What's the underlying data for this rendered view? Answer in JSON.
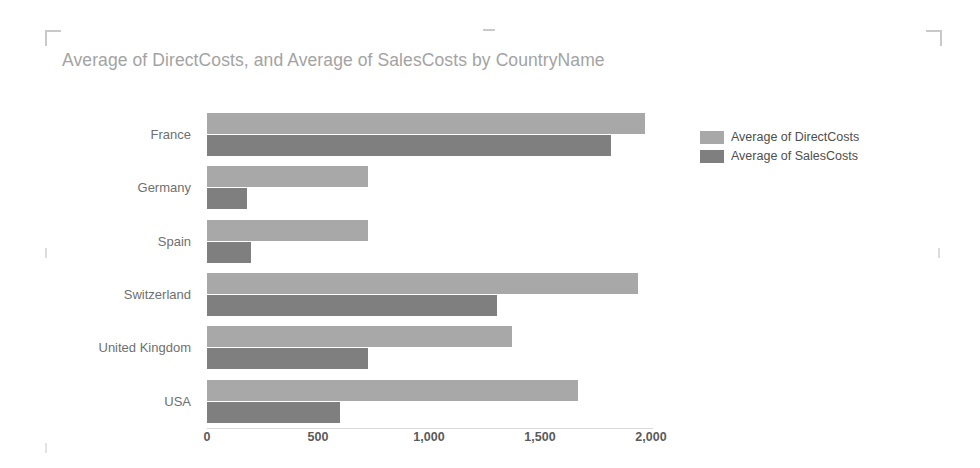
{
  "chart_data": {
    "type": "bar",
    "orientation": "horizontal",
    "title": "Average of DirectCosts, and Average of SalesCosts by CountryName",
    "xlabel": "",
    "ylabel": "",
    "xlim": [
      0,
      2000
    ],
    "grid": false,
    "legend_position": "right",
    "categories": [
      "France",
      "Germany",
      "Spain",
      "Switzerland",
      "United Kingdom",
      "USA"
    ],
    "xticks": [
      "0",
      "500",
      "1,000",
      "1,500",
      "2,000"
    ],
    "xtick_values": [
      0,
      500,
      1000,
      1500,
      2000
    ],
    "series": [
      {
        "name": "Average of DirectCosts",
        "color": "#a8a8a8",
        "values": [
          1973,
          725,
          726,
          1941,
          1374,
          1671
        ]
      },
      {
        "name": "Average of SalesCosts",
        "color": "#7f7f7f",
        "values": [
          1820,
          180,
          198,
          1306,
          725,
          599
        ]
      }
    ]
  },
  "legend": {
    "items": [
      {
        "label": "Average of DirectCosts"
      },
      {
        "label": "Average of SalesCosts"
      }
    ]
  },
  "frame": {
    "handle_top_left": "crop-mark-top-left",
    "handle_top_center": "crop-mark-top-center",
    "handle_top_right": "crop-mark-top-right",
    "handle_mid_left": "crop-mark-mid-left",
    "handle_mid_right": "crop-mark-mid-right",
    "handle_bottom_left": "crop-mark-bottom-left"
  }
}
